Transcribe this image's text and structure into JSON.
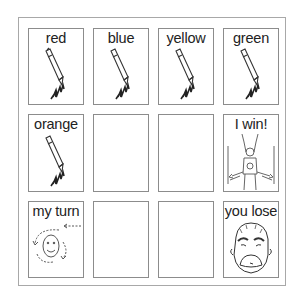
{
  "board": {
    "cards": [
      {
        "label": "red",
        "icon": "crayon-icon"
      },
      {
        "label": "blue",
        "icon": "crayon-icon"
      },
      {
        "label": "yellow",
        "icon": "crayon-icon"
      },
      {
        "label": "green",
        "icon": "crayon-icon"
      },
      {
        "label": "orange",
        "icon": "crayon-icon"
      },
      {
        "label": "",
        "icon": ""
      },
      {
        "label": "",
        "icon": ""
      },
      {
        "label": "I win!",
        "icon": "winner-person-icon"
      },
      {
        "label": "my turn",
        "icon": "turn-arrows-face-icon"
      },
      {
        "label": "",
        "icon": ""
      },
      {
        "label": "",
        "icon": ""
      },
      {
        "label": "you lose",
        "icon": "sad-face-icon"
      }
    ]
  },
  "colors": {
    "border": "#8c8c8c",
    "outer_border": "#a8a8a8",
    "text": "#222222"
  }
}
